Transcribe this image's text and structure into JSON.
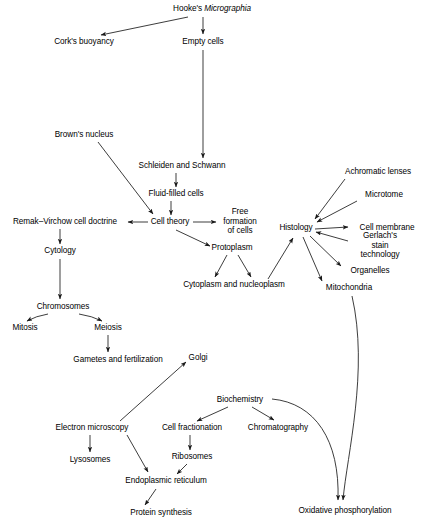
{
  "diagram": {
    "type": "flowchart",
    "background_color": "#ffffff",
    "line_color": "#1a1a1a",
    "text_color": "#000000",
    "caption": ""
  },
  "nodes": [
    {
      "id": "hookes_micrographia",
      "label_plain": "Hooke's Micrographia",
      "label_pre": "Hooke's ",
      "label_italic": "Micrographia",
      "label_post": "",
      "x": 212,
      "y": 9,
      "multiline": false
    },
    {
      "id": "corks_buoyancy",
      "label_plain": "Cork's buoyancy",
      "x": 84,
      "y": 42,
      "multiline": false
    },
    {
      "id": "empty_cells",
      "label_plain": "Empty cells",
      "x": 203,
      "y": 42,
      "multiline": false
    },
    {
      "id": "browns_nucleus",
      "label_plain": "Brown's nucleus",
      "x": 84,
      "y": 135,
      "multiline": false
    },
    {
      "id": "schleiden_and_schwann",
      "label_plain": "Schleiden and Schwann",
      "x": 182,
      "y": 166,
      "multiline": false
    },
    {
      "id": "fluid_filled_cells",
      "label_plain": "Fluid-filled cells",
      "x": 176,
      "y": 194,
      "multiline": false
    },
    {
      "id": "remak_virchow_cell_doctrine",
      "label_plain": "Remak–Virchow cell doctrine",
      "x": 65,
      "y": 222,
      "multiline": false
    },
    {
      "id": "cell_theory",
      "label_plain": "Cell theory",
      "x": 170,
      "y": 222,
      "multiline": false
    },
    {
      "id": "free_formation_of_cells",
      "label_plain": "Free\nformation\nof cells",
      "x": 240,
      "y": 221,
      "multiline": true
    },
    {
      "id": "histology",
      "label_plain": "Histology",
      "x": 296,
      "y": 228,
      "multiline": false
    },
    {
      "id": "achromatic_lenses",
      "label_plain": "Achromatic lenses",
      "x": 378,
      "y": 172,
      "multiline": false
    },
    {
      "id": "microtome",
      "label_plain": "Microtome",
      "x": 384,
      "y": 195,
      "multiline": false
    },
    {
      "id": "cell_membrane",
      "label_plain": "Cell membrane",
      "x": 387,
      "y": 228,
      "multiline": false
    },
    {
      "id": "gerlachs_stain_technology",
      "label_plain": "Gerlach's\nstain technology",
      "x": 380,
      "y": 245,
      "multiline": true
    },
    {
      "id": "organelles",
      "label_plain": "Organelles",
      "x": 370,
      "y": 271,
      "multiline": false
    },
    {
      "id": "mitochondria",
      "label_plain": "Mitochondria",
      "x": 349,
      "y": 288,
      "multiline": false
    },
    {
      "id": "cytology",
      "label_plain": "Cytology",
      "x": 60,
      "y": 251,
      "multiline": false
    },
    {
      "id": "protoplasm",
      "label_plain": "Protoplasm",
      "x": 232,
      "y": 248,
      "multiline": false
    },
    {
      "id": "cytoplasm_and_nucleoplasm",
      "label_plain": "Cytoplasm and nucleoplasm",
      "x": 234,
      "y": 285,
      "multiline": false
    },
    {
      "id": "chromosomes",
      "label_plain": "Chromosomes",
      "x": 63,
      "y": 307,
      "multiline": false
    },
    {
      "id": "mitosis",
      "label_plain": "Mitosis",
      "x": 25,
      "y": 328,
      "multiline": false
    },
    {
      "id": "meiosis",
      "label_plain": "Meiosis",
      "x": 108,
      "y": 328,
      "multiline": false
    },
    {
      "id": "gametes_and_fertilization",
      "label_plain": "Gametes and fertilization",
      "x": 118,
      "y": 360,
      "multiline": false
    },
    {
      "id": "golgi",
      "label_plain": "Golgi",
      "x": 198,
      "y": 358,
      "multiline": false
    },
    {
      "id": "biochemistry",
      "label_plain": "Biochemistry",
      "x": 240,
      "y": 400,
      "multiline": false
    },
    {
      "id": "electron_microscopy",
      "label_plain": "Electron microscopy",
      "x": 92,
      "y": 428,
      "multiline": false
    },
    {
      "id": "cell_fractionation",
      "label_plain": "Cell fractionation",
      "x": 192,
      "y": 428,
      "multiline": false
    },
    {
      "id": "chromatography",
      "label_plain": "Chromatography",
      "x": 278,
      "y": 428,
      "multiline": false
    },
    {
      "id": "lysosomes",
      "label_plain": "Lysosomes",
      "x": 90,
      "y": 460,
      "multiline": false
    },
    {
      "id": "ribosomes",
      "label_plain": "Ribosomes",
      "x": 192,
      "y": 457,
      "multiline": false
    },
    {
      "id": "endoplasmic_reticulum",
      "label_plain": "Endoplasmic reticulum",
      "x": 166,
      "y": 481,
      "multiline": false
    },
    {
      "id": "protein_synthesis",
      "label_plain": "Protein synthesis",
      "x": 161,
      "y": 513,
      "multiline": false
    },
    {
      "id": "oxidative_phosphorylation",
      "label_plain": "Oxidative phosphorylation",
      "x": 345,
      "y": 511,
      "multiline": false
    }
  ],
  "edges": [
    {
      "from": "hookes_micrographia",
      "to": "corks_buoyancy",
      "style": "straight"
    },
    {
      "from": "hookes_micrographia",
      "to": "empty_cells",
      "style": "straight"
    },
    {
      "from": "empty_cells",
      "to": "schleiden_and_schwann",
      "style": "straight"
    },
    {
      "from": "browns_nucleus",
      "to": "cell_theory",
      "style": "straight"
    },
    {
      "from": "schleiden_and_schwann",
      "to": "fluid_filled_cells",
      "style": "straight"
    },
    {
      "from": "fluid_filled_cells",
      "to": "cell_theory",
      "style": "straight"
    },
    {
      "from": "cell_theory",
      "to": "remak_virchow_cell_doctrine",
      "style": "straight"
    },
    {
      "from": "cell_theory",
      "to": "free_formation_of_cells",
      "style": "straight"
    },
    {
      "from": "cell_theory",
      "to": "protoplasm",
      "style": "straight"
    },
    {
      "from": "remak_virchow_cell_doctrine",
      "to": "cytology",
      "style": "straight"
    },
    {
      "from": "protoplasm",
      "to": "cytoplasm_and_nucleoplasm",
      "style": "straight"
    },
    {
      "from": "protoplasm",
      "to": "cytoplasm_and_nucleoplasm",
      "style": "straight"
    },
    {
      "from": "cytology",
      "to": "chromosomes",
      "style": "straight"
    },
    {
      "from": "chromosomes",
      "to": "mitosis",
      "style": "straight"
    },
    {
      "from": "chromosomes",
      "to": "meiosis",
      "style": "straight"
    },
    {
      "from": "meiosis",
      "to": "gametes_and_fertilization",
      "style": "straight"
    },
    {
      "from": "achromatic_lenses",
      "to": "histology",
      "style": "straight"
    },
    {
      "from": "microtome",
      "to": "histology",
      "style": "straight"
    },
    {
      "from": "histology",
      "to": "cell_membrane",
      "style": "straight"
    },
    {
      "from": "gerlachs_stain_technology",
      "to": "histology",
      "style": "straight"
    },
    {
      "from": "histology",
      "to": "organelles",
      "style": "straight"
    },
    {
      "from": "histology",
      "to": "mitochondria",
      "style": "straight"
    },
    {
      "from": "cytoplasm_and_nucleoplasm",
      "to": "histology",
      "style": "straight"
    },
    {
      "from": "electron_microscopy",
      "to": "golgi",
      "style": "straight"
    },
    {
      "from": "electron_microscopy",
      "to": "lysosomes",
      "style": "straight"
    },
    {
      "from": "electron_microscopy",
      "to": "endoplasmic_reticulum",
      "style": "straight"
    },
    {
      "from": "biochemistry",
      "to": "cell_fractionation",
      "style": "straight"
    },
    {
      "from": "biochemistry",
      "to": "chromatography",
      "style": "straight"
    },
    {
      "from": "biochemistry",
      "to": "oxidative_phosphorylation",
      "style": "curved"
    },
    {
      "from": "cell_fractionation",
      "to": "ribosomes",
      "style": "straight"
    },
    {
      "from": "ribosomes",
      "to": "endoplasmic_reticulum",
      "style": "straight"
    },
    {
      "from": "endoplasmic_reticulum",
      "to": "protein_synthesis",
      "style": "straight"
    },
    {
      "from": "mitochondria",
      "to": "oxidative_phosphorylation",
      "style": "curved"
    }
  ]
}
